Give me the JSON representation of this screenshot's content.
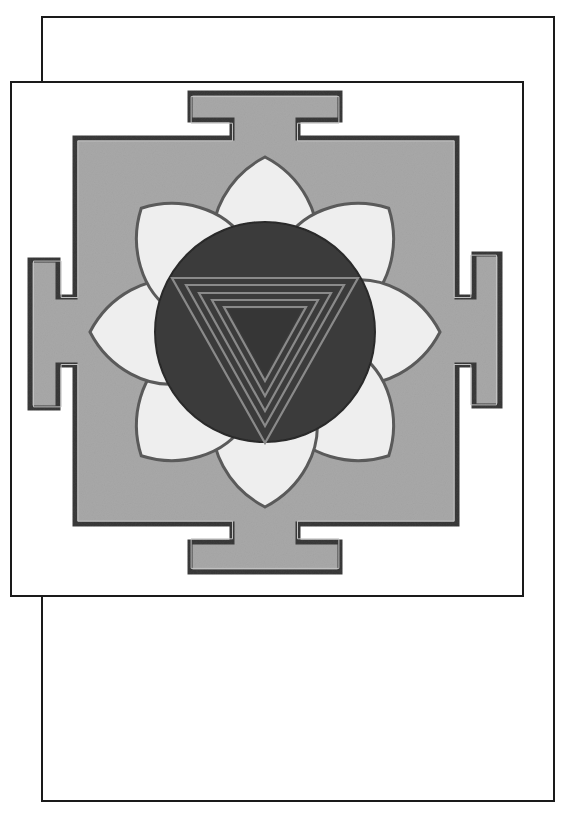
{
  "artwork": {
    "subject": "yantra",
    "colors": {
      "paper": "#ffffff",
      "frame_line": "#1a1a1a",
      "bhupura_fill": "#a8a8a8",
      "bhupura_outline": "#3a3a3a",
      "petal_fill": "#eeeeee",
      "petal_outline": "#5a5a5a",
      "circle_fill": "#3c3c3c",
      "triangle_line": "#8a8a8a"
    },
    "geometry": {
      "center": [
        265,
        332
      ],
      "circle_radius": 110,
      "petal_count": 8,
      "triangle_count": 5
    }
  }
}
